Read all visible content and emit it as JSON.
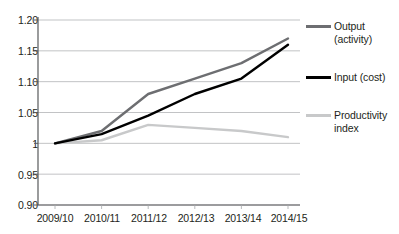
{
  "chart_data": {
    "type": "line",
    "title": "",
    "subtitle": "",
    "xlabel": "",
    "ylabel": "",
    "categories": [
      "2009/10",
      "2010/11",
      "2011/12",
      "2012/13",
      "2013/14",
      "2014/15"
    ],
    "ylim": [
      0.9,
      1.2
    ],
    "yticks": [
      0.9,
      0.95,
      1.0,
      1.05,
      1.1,
      1.15,
      1.2
    ],
    "ytick_labels": [
      "0.90",
      "0.95",
      "1",
      "1.05",
      "1.10",
      "1.15",
      "1.20"
    ],
    "grid": "horizontal",
    "legend_position": "right",
    "series": [
      {
        "name": "Output (activity)",
        "color": "#6d6e71",
        "values": [
          1.0,
          1.02,
          1.08,
          1.105,
          1.13,
          1.17
        ]
      },
      {
        "name": "Input (cost)",
        "color": "#000000",
        "values": [
          1.0,
          1.015,
          1.045,
          1.08,
          1.105,
          1.16
        ]
      },
      {
        "name": "Productivity index",
        "color": "#c8c9ca",
        "values": [
          1.0,
          1.005,
          1.03,
          1.025,
          1.02,
          1.01
        ]
      }
    ]
  },
  "legend": {
    "entries": [
      {
        "label": "Output (activity)",
        "color": "#6d6e71"
      },
      {
        "label": "Input (cost)",
        "color": "#000000"
      },
      {
        "label": "Productivity index",
        "color": "#c8c9ca"
      }
    ]
  },
  "axes": {
    "y_labels": [
      "1.20",
      "1.15",
      "1.10",
      "1.05",
      "1",
      "0.95",
      "0.90"
    ],
    "x_labels": [
      "2009/10",
      "2010/11",
      "2011/12",
      "2012/13",
      "2013/14",
      "2014/15"
    ]
  }
}
